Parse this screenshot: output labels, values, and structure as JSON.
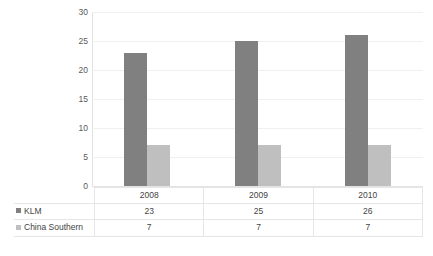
{
  "chart_data": {
    "type": "bar",
    "title": "",
    "subtitle": "",
    "xlabel": "",
    "ylabel": "",
    "categories": [
      "2008",
      "2009",
      "2010"
    ],
    "series": [
      {
        "name": "KLM",
        "values": [
          23,
          25,
          26
        ],
        "color": "#808080"
      },
      {
        "name": "China Southern",
        "values": [
          7,
          7,
          7
        ],
        "color": "#bfbfbf"
      }
    ],
    "ylim": [
      0,
      30
    ],
    "yticks": [
      0,
      5,
      10,
      15,
      20,
      25,
      30
    ],
    "ytick_labels": [
      "0",
      "5",
      "10",
      "15",
      "20",
      "25",
      "30"
    ],
    "grid": true,
    "grid_axis": "y",
    "legend_position": "data-table-left",
    "has_data_table": true,
    "annotations": []
  },
  "data_table": {
    "header_row_label": "",
    "columns": [
      "2008",
      "2009",
      "2010"
    ],
    "rows": [
      {
        "label": "KLM",
        "swatch": "#808080",
        "values": [
          "23",
          "25",
          "26"
        ]
      },
      {
        "label": "China Southern",
        "swatch": "#bfbfbf",
        "values": [
          "7",
          "7",
          "7"
        ]
      }
    ]
  },
  "colors": {
    "background": "#ffffff",
    "gridline": "#f0f0f0",
    "axis": "#e0e0e0",
    "table_border": "#e6e6e6",
    "text": "#444444",
    "tick_text": "#5a5a5a",
    "series_klm": "#808080",
    "series_china_southern": "#bfbfbf"
  }
}
